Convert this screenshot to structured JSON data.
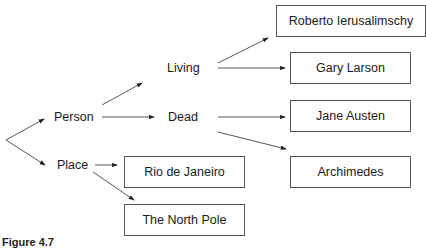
{
  "diagram": {
    "nodes": {
      "person": "Person",
      "place": "Place",
      "living": "Living",
      "dead": "Dead"
    },
    "leaves": {
      "roberto": "Roberto Ierusalimschy",
      "gary": "Gary Larson",
      "jane": "Jane Austen",
      "archimedes": "Archimedes",
      "rio": "Rio de Janeiro",
      "north_pole": "The North Pole"
    },
    "edges": [
      [
        "root",
        "Person"
      ],
      [
        "root",
        "Place"
      ],
      [
        "Person",
        "Living"
      ],
      [
        "Person",
        "Dead"
      ],
      [
        "Living",
        "Roberto Ierusalimschy"
      ],
      [
        "Living",
        "Gary Larson"
      ],
      [
        "Dead",
        "Jane Austen"
      ],
      [
        "Dead",
        "Archimedes"
      ],
      [
        "Place",
        "Rio de Janeiro"
      ],
      [
        "Place",
        "The North Pole"
      ]
    ],
    "caption": "Figure 4.7"
  }
}
